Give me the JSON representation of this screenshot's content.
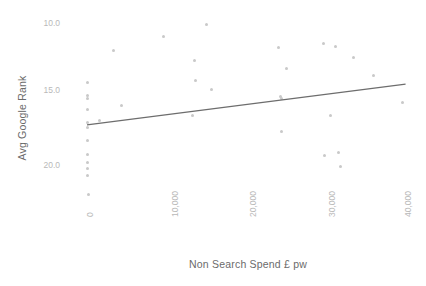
{
  "chart_data": {
    "type": "scatter",
    "title": "",
    "xlabel": "Non Search Spend £ pw",
    "ylabel": "Avg Google Rank",
    "xticks": [
      0,
      10000,
      20000,
      30000,
      40000
    ],
    "xtick_labels": [
      "0",
      "10,000",
      "20,000",
      "30,000",
      "40,000"
    ],
    "yticks": [
      10.0,
      15.0,
      20.0
    ],
    "ytick_labels": [
      "10.0",
      "15.0",
      "20.0"
    ],
    "xlim": [
      -2500,
      42000
    ],
    "ylim_display_inverted": true,
    "ylim": [
      9.0,
      23.0
    ],
    "grid": false,
    "legend": null,
    "point_color": "#c9c9c9",
    "trendline_color": "#6d6d6d",
    "points": [
      {
        "x": 0,
        "y": 14.2
      },
      {
        "x": 0,
        "y": 15.1
      },
      {
        "x": 0,
        "y": 15.3
      },
      {
        "x": 0,
        "y": 16.1
      },
      {
        "x": 0,
        "y": 17.0
      },
      {
        "x": 0,
        "y": 17.4
      },
      {
        "x": 0,
        "y": 18.3
      },
      {
        "x": 0,
        "y": 19.3
      },
      {
        "x": 0,
        "y": 19.9
      },
      {
        "x": 0,
        "y": 20.3
      },
      {
        "x": 0,
        "y": 20.8
      },
      {
        "x": 250,
        "y": 22.2
      },
      {
        "x": 1600,
        "y": 16.9
      },
      {
        "x": 3400,
        "y": 11.9
      },
      {
        "x": 4400,
        "y": 15.8
      },
      {
        "x": 9600,
        "y": 10.9
      },
      {
        "x": 13600,
        "y": 12.6
      },
      {
        "x": 13700,
        "y": 14.0
      },
      {
        "x": 13300,
        "y": 16.5
      },
      {
        "x": 15100,
        "y": 10.0
      },
      {
        "x": 15700,
        "y": 14.7
      },
      {
        "x": 24200,
        "y": 11.7
      },
      {
        "x": 24400,
        "y": 15.2
      },
      {
        "x": 24500,
        "y": 15.3
      },
      {
        "x": 24600,
        "y": 17.7
      },
      {
        "x": 25200,
        "y": 13.2
      },
      {
        "x": 29800,
        "y": 11.4
      },
      {
        "x": 30000,
        "y": 19.4
      },
      {
        "x": 30700,
        "y": 16.5
      },
      {
        "x": 31400,
        "y": 11.6
      },
      {
        "x": 31700,
        "y": 19.2
      },
      {
        "x": 32000,
        "y": 20.2
      },
      {
        "x": 33600,
        "y": 12.4
      },
      {
        "x": 36200,
        "y": 13.7
      },
      {
        "x": 39800,
        "y": 15.6
      }
    ],
    "trendline": {
      "x_start": 0,
      "y_start": 17.2,
      "x_end": 40200,
      "y_end": 14.3
    }
  }
}
